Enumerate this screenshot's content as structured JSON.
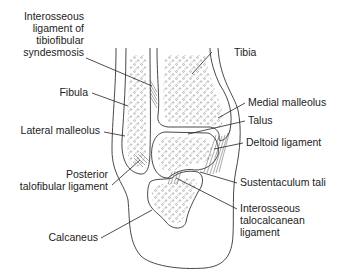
{
  "figure": {
    "labels": {
      "interosseous_tibiofibular": [
        "Interosseous",
        "ligament of",
        "tibiofibular",
        "syndesmosis"
      ],
      "tibia": "Tibia",
      "fibula": "Fibula",
      "medial_malleolus": "Medial malleolus",
      "lateral_malleolus": "Lateral malleolus",
      "talus": "Talus",
      "deltoid_ligament": "Deltoid ligament",
      "posterior_talofibular": [
        "Posterior",
        "talofibular ligament"
      ],
      "sustentaculum_tali": "Sustentaculum tali",
      "interosseous_talocalcanean": [
        "Interosseous",
        "talocalcanean",
        "ligament"
      ],
      "calcaneus": "Calcaneus"
    },
    "colors": {
      "line": "#333333",
      "text": "#222222",
      "background": "#ffffff"
    }
  }
}
